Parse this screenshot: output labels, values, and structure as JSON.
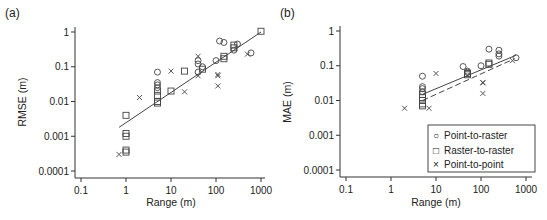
{
  "chart_data": [
    {
      "panel_label": "(a)",
      "type": "scatter",
      "xlabel": "Range (m)",
      "ylabel": "RMSE (m)",
      "xscale": "log",
      "yscale": "log",
      "xlim": [
        0.1,
        1000
      ],
      "ylim": [
        0.0001,
        1
      ],
      "xticks": [
        "0.1",
        "1",
        "10",
        "100",
        "1000"
      ],
      "yticks": [
        "1",
        "0.1",
        "0.01",
        "0.001",
        "0.0001"
      ],
      "series": [
        {
          "name": "Point-to-raster",
          "marker": "circle",
          "points": [
            [
              5,
              0.07
            ],
            [
              5,
              0.035
            ],
            [
              5,
              0.03
            ],
            [
              5,
              0.025
            ],
            [
              40,
              0.15
            ],
            [
              40,
              0.12
            ],
            [
              40,
              0.07
            ],
            [
              50,
              0.1
            ],
            [
              100,
              0.15
            ],
            [
              120,
              0.55
            ],
            [
              150,
              0.5
            ],
            [
              250,
              0.3
            ],
            [
              300,
              0.45
            ],
            [
              600,
              0.25
            ]
          ]
        },
        {
          "name": "Raster-to-raster",
          "marker": "square",
          "points": [
            [
              1,
              0.004
            ],
            [
              1,
              0.0012
            ],
            [
              1,
              0.001
            ],
            [
              1,
              0.0004
            ],
            [
              1,
              0.00035
            ],
            [
              5,
              0.02
            ],
            [
              5,
              0.015
            ],
            [
              5,
              0.01
            ],
            [
              5,
              0.009
            ],
            [
              10,
              0.02
            ],
            [
              20,
              0.075
            ],
            [
              50,
              0.085
            ],
            [
              150,
              0.17
            ],
            [
              150,
              0.2
            ],
            [
              250,
              0.35
            ],
            [
              250,
              0.42
            ],
            [
              1000,
              1.05
            ]
          ]
        },
        {
          "name": "Point-to-point",
          "marker": "x",
          "points": [
            [
              0.7,
              0.0003
            ],
            [
              2,
              0.013
            ],
            [
              10,
              0.075
            ],
            [
              20,
              0.019
            ],
            [
              40,
              0.2
            ],
            [
              40,
              0.055
            ],
            [
              110,
              0.06
            ],
            [
              110,
              0.055
            ],
            [
              110,
              0.028
            ],
            [
              500,
              0.23
            ]
          ]
        }
      ],
      "fit_lines": [
        {
          "style": "solid",
          "x": [
            0.7,
            1000
          ],
          "y": [
            0.0018,
            1.0
          ]
        }
      ]
    },
    {
      "panel_label": "(b)",
      "type": "scatter",
      "xlabel": "Range (m)",
      "ylabel": "MAE (m)",
      "xscale": "log",
      "yscale": "log",
      "xlim": [
        0.1,
        1000
      ],
      "ylim": [
        0.0001,
        1
      ],
      "xticks": [
        "0.1",
        "1",
        "10",
        "100",
        "1000"
      ],
      "yticks": [
        "1",
        "0.1",
        "0.01",
        "0.001",
        "0.0001"
      ],
      "series": [
        {
          "name": "Point-to-raster",
          "marker": "circle",
          "points": [
            [
              5,
              0.05
            ],
            [
              5,
              0.025
            ],
            [
              5,
              0.022
            ],
            [
              5,
              0.018
            ],
            [
              40,
              0.095
            ],
            [
              50,
              0.07
            ],
            [
              50,
              0.065
            ],
            [
              100,
              0.1
            ],
            [
              150,
              0.3
            ],
            [
              250,
              0.28
            ],
            [
              250,
              0.22
            ],
            [
              250,
              0.19
            ],
            [
              600,
              0.17
            ]
          ]
        },
        {
          "name": "Raster-to-raster",
          "marker": "square",
          "points": [
            [
              5,
              0.015
            ],
            [
              5,
              0.012
            ],
            [
              5,
              0.01
            ],
            [
              5,
              0.008
            ],
            [
              5,
              0.007
            ],
            [
              50,
              0.06
            ],
            [
              50,
              0.055
            ],
            [
              150,
              0.12
            ],
            [
              150,
              0.11
            ]
          ]
        },
        {
          "name": "Point-to-point",
          "marker": "x",
          "points": [
            [
              2,
              0.006
            ],
            [
              7,
              0.006
            ],
            [
              10,
              0.06
            ],
            [
              110,
              0.033
            ],
            [
              110,
              0.032
            ],
            [
              110,
              0.016
            ],
            [
              500,
              0.14
            ]
          ]
        }
      ],
      "fit_lines": [
        {
          "style": "solid",
          "x": [
            5,
            600
          ],
          "y": [
            0.015,
            0.2
          ]
        },
        {
          "style": "dashed",
          "x": [
            5,
            500
          ],
          "y": [
            0.01,
            0.15
          ]
        }
      ],
      "legend": {
        "position": "lower right",
        "entries": [
          {
            "symbol": "○",
            "label": "Point-to-raster"
          },
          {
            "symbol": "□",
            "label": "Raster-to-raster"
          },
          {
            "symbol": "×",
            "label": "Point-to-point"
          }
        ]
      }
    }
  ]
}
